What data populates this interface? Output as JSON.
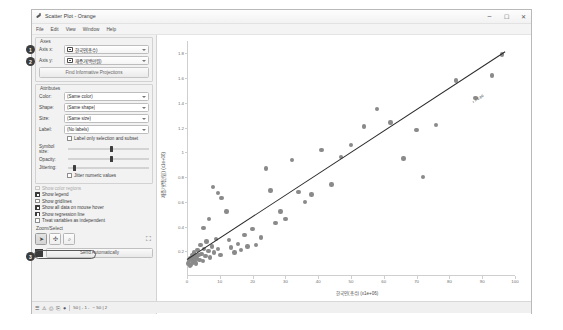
{
  "window": {
    "title": "Scatter Plot - Orange",
    "app_icon": "orange-widget-icon",
    "menu": [
      "File",
      "Edit",
      "View",
      "Window",
      "Help"
    ],
    "buttons": {
      "minimize": "–",
      "maximize": "☐",
      "close": "✕"
    }
  },
  "controls": {
    "axes": {
      "title": "Axes",
      "axis_x_label": "Axis x:",
      "axis_x_value": "한국인(총수)",
      "axis_y_label": "Axis y:",
      "axis_y_value": "재증가(백만원)",
      "find_projections_button": "Find Informative Projections"
    },
    "attributes": {
      "title": "Attributes",
      "color_label": "Color:",
      "color_value": "(Same color)",
      "shape_label": "Shape:",
      "shape_value": "(Same shape)",
      "size_label": "Size:",
      "size_value": "(Same size)",
      "label_label": "Label:",
      "label_value": "(No labels)",
      "label_only_selection": "Label only selection and subset",
      "label_only_selection_checked": false,
      "symbol_size_label": "Symbol size:",
      "symbol_size_pct": 52,
      "opacity_label": "Opacity:",
      "opacity_pct": 52,
      "jittering_label": "Jittering:",
      "jittering_pct": 6,
      "jitter_numeric": "Jitter numeric values",
      "jitter_numeric_checked": false
    },
    "options": [
      {
        "label": "Show color regions",
        "checked": false,
        "disabled": true
      },
      {
        "label": "Show legend",
        "checked": true,
        "disabled": false
      },
      {
        "label": "Show gridlines",
        "checked": false,
        "disabled": false
      },
      {
        "label": "Show all data on mouse hover",
        "checked": true,
        "disabled": false
      },
      {
        "label": "Show regression line",
        "checked": true,
        "disabled": false
      },
      {
        "label": "Treat variables as independent",
        "checked": false,
        "disabled": false
      }
    ],
    "zoom_select": {
      "title": "Zoom/Select",
      "tools": [
        {
          "name": "select-tool",
          "glyph": "➤",
          "active": true
        },
        {
          "name": "pan-tool",
          "glyph": "✣",
          "active": false
        },
        {
          "name": "zoom-tool",
          "glyph": "⌕",
          "active": false
        },
        {
          "name": "reset-zoom-tool",
          "glyph": "⛶",
          "active": false
        }
      ]
    },
    "send": {
      "label": "Send Automatically",
      "auto": true
    }
  },
  "callouts": [
    {
      "id": "1",
      "target": "axis-x-row"
    },
    {
      "id": "2",
      "target": "axis-y-row"
    },
    {
      "id": "3",
      "target": "show-regression-line"
    }
  ],
  "statusbar": {
    "icons": [
      "menu-icon",
      "info-icon",
      "copy-icon",
      "save-icon",
      "record-icon"
    ],
    "counters": [
      "50 | - 1 -",
      "− 50 | 2"
    ]
  },
  "chart_data": {
    "type": "scatter",
    "title": "",
    "xlabel": "한국인(총수) (x1e+06)",
    "ylabel": "재증가(백만원) (x1e+06)",
    "xlim": [
      0,
      100
    ],
    "ylim": [
      0,
      1.9
    ],
    "xticks": [
      0,
      10,
      20,
      30,
      40,
      50,
      60,
      70,
      80,
      90,
      100
    ],
    "xticklabels": [
      "0",
      "10",
      "20",
      "30",
      "40",
      "50",
      "60",
      "70",
      "80",
      "90",
      "100"
    ],
    "yticks": [
      0.2,
      0.4,
      0.6,
      0.8,
      1.0,
      1.2,
      1.4,
      1.6,
      1.8
    ],
    "yticklabels": [
      "0.2",
      "0.4",
      "0.6",
      "0.8",
      "1",
      "1.2",
      "1.4",
      "1.6",
      "1.8"
    ],
    "grid": false,
    "legend": "none",
    "point_color": "#8a8a8a",
    "regression_color": "#2b2b2b",
    "regression_label": "r = 0.80",
    "regression": {
      "x0": 0,
      "y0": 0.14,
      "x1": 97,
      "y1": 1.82
    },
    "points": [
      [
        0.4,
        0.1
      ],
      [
        0.7,
        0.12
      ],
      [
        0.9,
        0.08
      ],
      [
        1.1,
        0.14
      ],
      [
        1.3,
        0.09
      ],
      [
        1.5,
        0.13
      ],
      [
        1.6,
        0.17
      ],
      [
        1.8,
        0.11
      ],
      [
        2.0,
        0.15
      ],
      [
        2.2,
        0.19
      ],
      [
        2.4,
        0.12
      ],
      [
        2.6,
        0.16
      ],
      [
        2.8,
        0.1
      ],
      [
        3.0,
        0.14
      ],
      [
        3.2,
        0.21
      ],
      [
        3.5,
        0.17
      ],
      [
        3.8,
        0.13
      ],
      [
        4.1,
        0.25
      ],
      [
        4.4,
        0.18
      ],
      [
        4.8,
        0.12
      ],
      [
        5.2,
        0.22
      ],
      [
        5.6,
        0.16
      ],
      [
        6.0,
        0.28
      ],
      [
        6.5,
        0.2
      ],
      [
        7.0,
        0.15
      ],
      [
        7.6,
        0.24
      ],
      [
        8.2,
        0.19
      ],
      [
        8.8,
        0.3
      ],
      [
        9.5,
        0.22
      ],
      [
        10.2,
        0.17
      ],
      [
        5.0,
        0.39
      ],
      [
        6.8,
        0.46
      ],
      [
        8.0,
        0.72
      ],
      [
        9.4,
        0.67
      ],
      [
        10.5,
        0.63
      ],
      [
        12.0,
        0.52
      ],
      [
        12.8,
        0.29
      ],
      [
        13.5,
        0.23
      ],
      [
        14.5,
        0.19
      ],
      [
        15.5,
        0.26
      ],
      [
        16.5,
        0.21
      ],
      [
        17.5,
        0.33
      ],
      [
        18.5,
        0.24
      ],
      [
        20.0,
        0.38
      ],
      [
        21.0,
        0.25
      ],
      [
        22.5,
        0.31
      ],
      [
        24.0,
        0.87
      ],
      [
        25.5,
        0.69
      ],
      [
        27.0,
        0.43
      ],
      [
        28.5,
        0.52
      ],
      [
        30.0,
        0.46
      ],
      [
        32.0,
        0.94
      ],
      [
        34.0,
        0.68
      ],
      [
        36.0,
        0.6
      ],
      [
        38.0,
        0.66
      ],
      [
        41.0,
        1.02
      ],
      [
        44.0,
        0.74
      ],
      [
        47.0,
        0.96
      ],
      [
        50.0,
        1.06
      ],
      [
        54.0,
        1.21
      ],
      [
        58.0,
        1.35
      ],
      [
        62.0,
        1.24
      ],
      [
        66.0,
        0.95
      ],
      [
        70.0,
        1.18
      ],
      [
        76.0,
        1.22
      ],
      [
        82.0,
        1.58
      ],
      [
        88.0,
        1.44
      ],
      [
        93.0,
        1.62
      ],
      [
        96.0,
        1.79
      ],
      [
        72.0,
        0.8
      ]
    ]
  }
}
